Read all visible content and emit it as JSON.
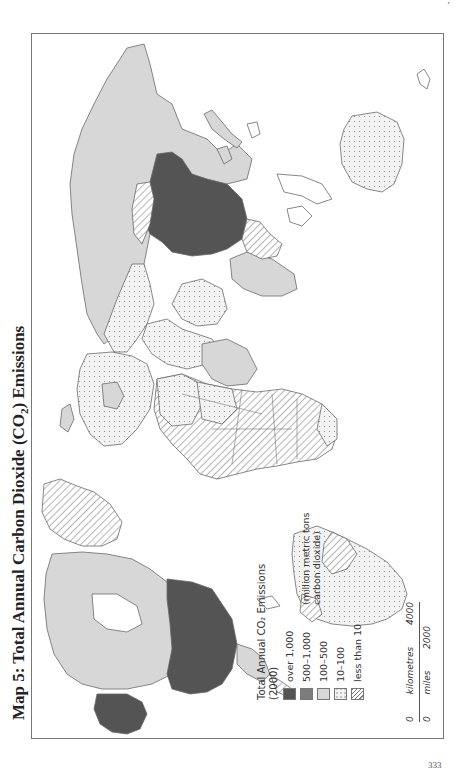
{
  "title": {
    "prefix": "Map 5: Total Annual Carbon Dioxide (CO",
    "subscript": "2",
    "suffix": ") Emissions"
  },
  "legend": {
    "title_line1": "Total Annual CO₂ Emissions",
    "title_line2": "(2000)",
    "unit_line1": "(million metric tons",
    "unit_line2": "carbon dioxide)",
    "classes": [
      {
        "label": "over 1,000",
        "fill": "#545454",
        "pattern": "solid"
      },
      {
        "label": "500–1,000",
        "fill": "#7c7c7c",
        "pattern": "solid"
      },
      {
        "label": "100–500",
        "fill": "#d7d7d7",
        "pattern": "solid"
      },
      {
        "label": "10–100",
        "fill": "#f3f3f3",
        "pattern": "dots"
      },
      {
        "label": "less than 10",
        "fill": "#ffffff",
        "pattern": "hatch"
      }
    ]
  },
  "scale_bar": {
    "km_start": "0",
    "km_label": "kilometres",
    "km_end": "4000",
    "mi_start": "0",
    "mi_label": "miles",
    "mi_end": "2000"
  },
  "colors": {
    "frame": "#777777",
    "coast": "#6a6a6a",
    "over_1000": "#545454",
    "c500_1000": "#7c7c7c",
    "c100_500": "#d7d7d7",
    "c10_100": "#f3f3f3"
  },
  "page": {
    "top_mark": "’",
    "bottom_number": "333"
  }
}
